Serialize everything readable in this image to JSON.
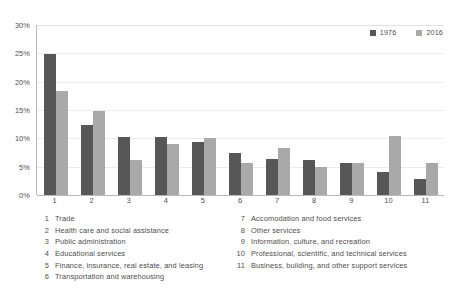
{
  "chart_data": {
    "type": "bar",
    "title": "",
    "subtitle": "",
    "xlabel": "",
    "ylabel": "",
    "ylim": [
      0,
      30
    ],
    "ytick_labels": [
      "0%",
      "5%",
      "10%",
      "15%",
      "20%",
      "25%",
      "30%"
    ],
    "ytick_values": [
      0,
      5,
      10,
      15,
      20,
      25,
      30
    ],
    "grid": true,
    "legend_position": "top-right",
    "value_suffix": "%",
    "categories": [
      "1",
      "2",
      "3",
      "4",
      "5",
      "6",
      "7",
      "8",
      "9",
      "10",
      "11"
    ],
    "category_names": [
      "Trade",
      "Health care and social assistance",
      "Public administration",
      "Educational services",
      "Finance, insurance, real estate, and leasing",
      "Transportation and warehousing",
      "Accomodation and food services",
      "Other services",
      "Information, culture, and recreation",
      "Professional, scientific, and technical services",
      "Business, building, and other support services"
    ],
    "series": [
      {
        "name": "1976",
        "color": "#575757",
        "values": [
          24.8,
          12.3,
          10.3,
          10.2,
          9.3,
          7.5,
          6.4,
          6.2,
          5.6,
          4.1,
          2.9
        ]
      },
      {
        "name": "2016",
        "color": "#a9a9a9",
        "values": [
          18.4,
          14.9,
          6.2,
          9.0,
          10.0,
          5.7,
          8.3,
          5.0,
          5.6,
          10.5,
          5.7
        ]
      }
    ]
  },
  "series_legend": [
    {
      "label": "1976",
      "swatch_color": "#575757",
      "icon": "square-swatch-icon"
    },
    {
      "label": "2016",
      "swatch_color": "#a9a9a9",
      "icon": "square-swatch-icon"
    }
  ],
  "category_key": {
    "left_column": [
      {
        "num": "1",
        "text": "Trade"
      },
      {
        "num": "2",
        "text": "Health care and social assistance"
      },
      {
        "num": "3",
        "text": "Public administration"
      },
      {
        "num": "4",
        "text": "Educational services"
      },
      {
        "num": "5",
        "text": "Finance, insurance, real estate, and leasing"
      },
      {
        "num": "6",
        "text": "Transportation and warehousing"
      }
    ],
    "right_column": [
      {
        "num": "7",
        "text": "Accomodation and food services"
      },
      {
        "num": "8",
        "text": "Other services"
      },
      {
        "num": "9",
        "text": "Information, culture, and recreation"
      },
      {
        "num": "10",
        "text": "Professional, scientific, and technical services"
      },
      {
        "num": "11",
        "text": "Business, building, and other support services"
      }
    ]
  }
}
